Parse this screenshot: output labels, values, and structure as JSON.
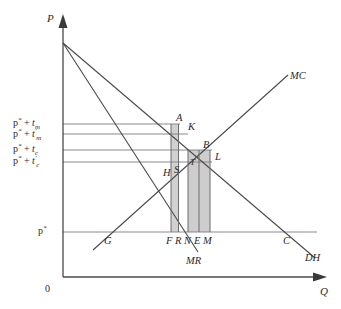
{
  "figure": {
    "type": "economics-line-diagram",
    "axes": {
      "y_label": "P",
      "x_label": "Q",
      "origin_label": "0"
    },
    "y_ticks": [
      {
        "id": "p-star-plus-tm",
        "text": "p* + tm",
        "base": "p",
        "star": "*",
        "plus": "+",
        "var": "t",
        "sub": "m",
        "prime": "",
        "y": 124
      },
      {
        "id": "p-star-plus-tm-prime",
        "text": "p* + t'm",
        "base": "p",
        "star": "*",
        "plus": "+",
        "var": "t",
        "sub": "m",
        "prime": "'",
        "y": 134
      },
      {
        "id": "p-star-plus-tc",
        "text": "p* + tc",
        "base": "p",
        "star": "*",
        "plus": "+",
        "var": "t",
        "sub": "c",
        "prime": "",
        "y": 150
      },
      {
        "id": "p-star-plus-tc-prime",
        "text": "p* + t'c",
        "base": "p",
        "star": "*",
        "plus": "+",
        "var": "t",
        "sub": "c",
        "prime": "'",
        "y": 162
      },
      {
        "id": "p-star",
        "text": "p*",
        "base": "p",
        "star": "*",
        "plus": "",
        "var": "",
        "sub": "",
        "prime": "",
        "y": 232
      }
    ],
    "curves": [
      {
        "id": "mc",
        "label": "MC",
        "description": "marginal cost, upward sloping"
      },
      {
        "id": "dh",
        "label": "DH",
        "description": "domestic demand, downward sloping"
      },
      {
        "id": "mr",
        "label": "MR",
        "description": "marginal revenue, steeper downward sloping"
      }
    ],
    "points": [
      {
        "id": "A",
        "label": "A"
      },
      {
        "id": "K",
        "label": "K"
      },
      {
        "id": "B",
        "label": "B"
      },
      {
        "id": "L",
        "label": "L"
      },
      {
        "id": "H",
        "label": "H"
      },
      {
        "id": "S",
        "label": "S"
      },
      {
        "id": "T",
        "label": "T"
      },
      {
        "id": "G",
        "label": "G"
      },
      {
        "id": "C",
        "label": "C"
      }
    ],
    "x_markers": [
      {
        "id": "F",
        "label": "F"
      },
      {
        "id": "R",
        "label": "R"
      },
      {
        "id": "N",
        "label": "N"
      },
      {
        "id": "E",
        "label": "E"
      },
      {
        "id": "M",
        "label": "M"
      }
    ],
    "shaded_regions": [
      {
        "id": "region-fr",
        "description": "narrow shaded rectangle between F and R under A",
        "color": "#c9c9c9"
      },
      {
        "id": "region-nm",
        "description": "wider shaded rectangle between N and M under B/L",
        "color": "#c4c4c4"
      }
    ],
    "colors": {
      "axis": "#4a4a4a",
      "curve": "#4a4a4a",
      "guide": "#8a8a8a",
      "shade": "#c7c7c7",
      "text": "#2a2a2a",
      "background": "#ffffff"
    }
  }
}
